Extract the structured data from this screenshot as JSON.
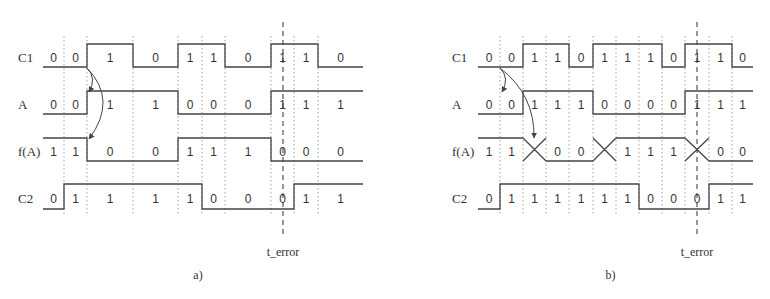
{
  "diagrams": [
    {
      "id": "a",
      "caption": "a)",
      "error_label": "t_error",
      "boundaries": [
        43,
        64,
        87,
        133,
        178,
        202,
        225,
        271,
        294,
        318,
        363
      ],
      "error_x": 283,
      "signals": [
        {
          "name": "C1",
          "values": [
            "0",
            "0",
            "1",
            "0",
            "1",
            "1",
            "0",
            "1",
            "1",
            "0"
          ]
        },
        {
          "name": "A",
          "values": [
            "0",
            "0",
            "1",
            "1",
            "0",
            "0",
            "0",
            "1",
            "1",
            "1"
          ]
        },
        {
          "name": "f(A)",
          "values": [
            "1",
            "1",
            "0",
            "0",
            "1",
            "1",
            "1",
            "0",
            "0",
            "0"
          ],
          "transition": "sharp"
        },
        {
          "name": "C2",
          "values": [
            "0",
            "1",
            "1",
            "1",
            "1",
            "0",
            "0",
            "0",
            "1",
            "1"
          ]
        }
      ],
      "arrows": [
        {
          "from": [
            87,
            68
          ],
          "to": [
            89,
            92
          ],
          "ctrl": [
            97,
            78
          ]
        },
        {
          "from": [
            87,
            68
          ],
          "to": [
            89,
            139
          ],
          "ctrl": [
            118,
            100
          ]
        }
      ]
    },
    {
      "id": "b",
      "caption": "b)",
      "error_label": "t_error",
      "boundaries": [
        478,
        500,
        523,
        546,
        569,
        593,
        616,
        639,
        662,
        685,
        709,
        732,
        753
      ],
      "error_x": 697,
      "signals": [
        {
          "name": "C1",
          "values": [
            "0",
            "0",
            "1",
            "1",
            "0",
            "1",
            "1",
            "1",
            "0",
            "1",
            "1",
            "0"
          ]
        },
        {
          "name": "A",
          "values": [
            "0",
            "0",
            "1",
            "1",
            "1",
            "0",
            "0",
            "0",
            "0",
            "1",
            "1",
            "1"
          ]
        },
        {
          "name": "f(A)",
          "values": [
            "1",
            "1",
            "X",
            "0",
            "0",
            "X",
            "1",
            "1",
            "1",
            "X",
            "0",
            "0"
          ],
          "transition": "cross"
        },
        {
          "name": "C2",
          "values": [
            "0",
            "1",
            "1",
            "1",
            "1",
            "1",
            "1",
            "0",
            "0",
            "0",
            "1",
            "1"
          ]
        }
      ],
      "arrows": [
        {
          "from": [
            500,
            68
          ],
          "to": [
            502,
            92
          ],
          "ctrl": [
            510,
            78
          ]
        },
        {
          "from": [
            500,
            68
          ],
          "to": [
            534,
            138
          ],
          "ctrl": [
            535,
            95
          ]
        }
      ]
    }
  ],
  "layout": {
    "rows": [
      {
        "high": 44,
        "low": 67,
        "label_y": 62
      },
      {
        "high": 91,
        "low": 114,
        "label_y": 109
      },
      {
        "high": 138,
        "low": 161,
        "label_y": 156
      },
      {
        "high": 184,
        "low": 209,
        "label_y": 203
      }
    ],
    "grid_top": 36,
    "grid_bottom": 216,
    "error_top": 22,
    "error_bottom": 238,
    "error_label_y": 256,
    "caption_y": 279,
    "label_x": {
      "a": 18,
      "b": 452
    }
  }
}
